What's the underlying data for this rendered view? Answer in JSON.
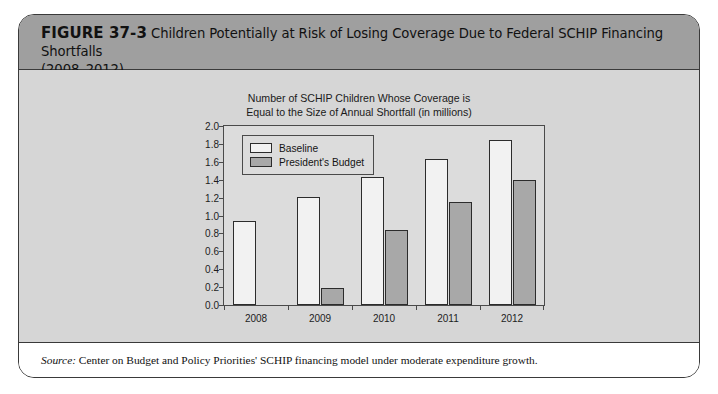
{
  "figure": {
    "number_label": "FIGURE 37-3",
    "title_line1": "Children Potentially at Risk of Losing Coverage Due to Federal SCHIP Financing Shortfalls",
    "title_line2": "(2008–2012)"
  },
  "source": {
    "label": "Source:",
    "text": " Center on Budget and Policy Priorities' SCHIP financing model under moderate expenditure growth."
  },
  "colors": {
    "header_band": "#9f9f9f",
    "chart_plate": "#d6d6d6",
    "plot_background": "#dcdcdc",
    "baseline_fill": "#f2f2f2",
    "president_fill": "#a8a8a8",
    "outline": "#2c2c2c"
  },
  "chart_data": {
    "type": "bar",
    "title": "Number of SCHIP Children Whose Coverage is\nEqual to the Size of Annual Shortfall (in millions)",
    "title_line1": "Number of SCHIP Children Whose Coverage is",
    "title_line2": "Equal to the Size of Annual Shortfall (in millions)",
    "xlabel": "",
    "ylabel": "",
    "ylim": [
      0.0,
      2.0
    ],
    "ytick_step": 0.2,
    "ytick_labels": [
      "0.0",
      "0.2",
      "0.4",
      "0.6",
      "0.8",
      "1.0",
      "1.2",
      "1.4",
      "1.6",
      "1.8",
      "2.0"
    ],
    "ytick_values": [
      0.0,
      0.2,
      0.4,
      0.6,
      0.8,
      1.0,
      1.2,
      1.4,
      1.6,
      1.8,
      2.0
    ],
    "grid": false,
    "legend_position": "top-left",
    "categories": [
      "2008",
      "2009",
      "2010",
      "2011",
      "2012"
    ],
    "series": [
      {
        "name": "Baseline",
        "values": [
          0.94,
          1.21,
          1.43,
          1.63,
          1.84
        ]
      },
      {
        "name": "President's Budget",
        "values": [
          0.0,
          0.19,
          0.84,
          1.15,
          1.4
        ]
      }
    ]
  }
}
